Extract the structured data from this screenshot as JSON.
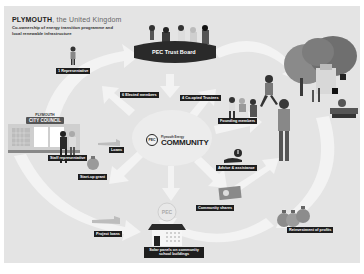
{
  "header": {
    "city": "PLYMOUTH",
    "country": ", the United Kingdom",
    "subtitle": "Co-ownership of energy transition programme and local renewable infrastructure"
  },
  "nodes": {
    "trust_board": "PEC Trust Board",
    "city_council_top": "PLYMOUTH",
    "city_council_main": "CITY COUNCIL",
    "community_small": "Plymouth Energy",
    "community_big": "COMMUNITY",
    "community_badge": "PEC",
    "solar_school": "Solar panels on community school buildings"
  },
  "labels": {
    "representative": "1 Representative",
    "elected_members": "6 Elected members",
    "coopted_trustees": "4 Co-opted Trustees",
    "founding_members": "Founding members",
    "staff_representative": "Staff representative",
    "loans": "Loans",
    "start_up_grant": "Start-up grant",
    "advice_assistance": "Advice & assistance",
    "community_shares": "Community shares",
    "reinvestment_profits": "Reinvestment of profits",
    "project_loans": "Project loans"
  },
  "colors": {
    "background": "#e4e4e4",
    "arrow": "#f4f4f4",
    "label_bg": "#1e1e1e",
    "dark": "#2a2a2a"
  }
}
